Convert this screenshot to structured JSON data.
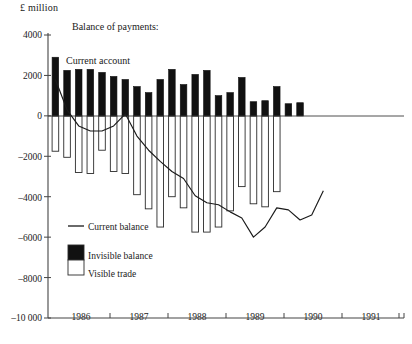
{
  "figure": {
    "unit_label": "£ million",
    "annotation_title": "Balance of payments:",
    "annotation_series": "Current account",
    "caption": "4    The current balance of payments"
  },
  "legend": {
    "line_label": "Current balance",
    "black_label": "Invisible balance",
    "white_label": "Visible trade",
    "line_color": "#1a1a1a",
    "black_color": "#111111",
    "white_color": "#ffffff"
  },
  "chart_data": {
    "type": "bar",
    "title": "Balance of payments: Current account",
    "xlabel": "",
    "ylabel": "£ million",
    "ylim": [
      -10000,
      4000
    ],
    "yticks": [
      4000,
      2000,
      0,
      -2000,
      -4000,
      -6000,
      -8000,
      -10000
    ],
    "ytick_labels": [
      "4000",
      "2000",
      "0",
      "–2000",
      "–4000",
      "–6000",
      "–8000",
      "–10 000"
    ],
    "xticks": [
      "1986",
      "1987",
      "1988",
      "1989",
      "1990",
      "1991"
    ],
    "grid": false,
    "legend_position": "lower-left",
    "categories": [
      "1986 Q1",
      "1986 Q2",
      "1986 Q3",
      "1986 Q4",
      "1987 Q1",
      "1987 Q2",
      "1987 Q3",
      "1987 Q4",
      "1988 Q1",
      "1988 Q2",
      "1988 Q3",
      "1988 Q4",
      "1989 Q1",
      "1989 Q2",
      "1989 Q3",
      "1989 Q4",
      "1990 Q1",
      "1990 Q2",
      "1990 Q3",
      "1990 Q4",
      "1991 Q1",
      "1991 Q2",
      "1991 Q3",
      "1991 Q4"
    ],
    "series": [
      {
        "name": "Invisible balance",
        "type": "bar",
        "color": "#111111",
        "values": [
          2900,
          2250,
          2300,
          2300,
          2150,
          1950,
          1800,
          1450,
          1150,
          1800,
          2300,
          1550,
          2050,
          2250,
          1000,
          1150,
          1900,
          700,
          750,
          1450,
          600,
          650,
          0,
          0
        ]
      },
      {
        "name": "Visible trade",
        "type": "bar",
        "color": "#ffffff",
        "values": [
          -1750,
          -2050,
          -2800,
          -2850,
          -1700,
          -2750,
          -2850,
          -3900,
          -4600,
          -5500,
          -4000,
          -4550,
          -5750,
          -5750,
          -5500,
          -4700,
          -3500,
          -4350,
          -4500,
          -3750,
          0,
          0,
          0,
          0
        ]
      },
      {
        "name": "Current balance",
        "type": "line",
        "color": "#1a1a1a",
        "values": [
          1800,
          300,
          -500,
          -750,
          -750,
          -500,
          100,
          -1000,
          -1700,
          -2250,
          -2750,
          -3100,
          -3950,
          -4300,
          -4400,
          -4750,
          -5050,
          -6000,
          -5500,
          -4550,
          -4650,
          -5150,
          -4900,
          -3700
        ]
      }
    ]
  }
}
